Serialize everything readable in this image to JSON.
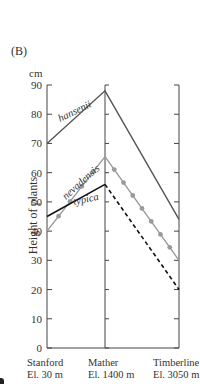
{
  "chart_data": {
    "type": "line",
    "panel_label": "(B)",
    "title": "",
    "xlabel": "",
    "ylabel": "Height of plants",
    "y_unit": "cm",
    "ylim": [
      0,
      90
    ],
    "yticks": [
      0,
      10,
      20,
      30,
      40,
      50,
      60,
      70,
      80,
      90
    ],
    "categories": [
      {
        "name": "Stanford",
        "elevation": "El. 30 m"
      },
      {
        "name": "Mather",
        "elevation": "El. 1400 m"
      },
      {
        "name": "Timberline",
        "elevation": "El. 3050 m"
      }
    ],
    "series": [
      {
        "name": "hansenii",
        "label": "hansenii",
        "values": [
          70,
          88,
          44
        ],
        "style": "solid",
        "color": "#555555"
      },
      {
        "name": "nevadensis",
        "label": "nevadensis",
        "values": [
          40,
          65.5,
          30
        ],
        "style": "solid-dotted-markers",
        "color": "#9a9a9a"
      },
      {
        "name": "typica",
        "label": "typica",
        "values": [
          45,
          56,
          20
        ],
        "style": "solid-then-dashed",
        "color": "#111111"
      }
    ],
    "grid": false,
    "legend": "inline labels on lines"
  },
  "labels": {
    "panel": "(B)",
    "unit": "cm",
    "ylabel": "Height of plants",
    "x0_name": "Stanford",
    "x0_elev": "El. 30 m",
    "x1_name": "Mather",
    "x1_elev": "El. 1400 m",
    "x2_name": "Timberline",
    "x2_elev": "El. 3050 m"
  }
}
